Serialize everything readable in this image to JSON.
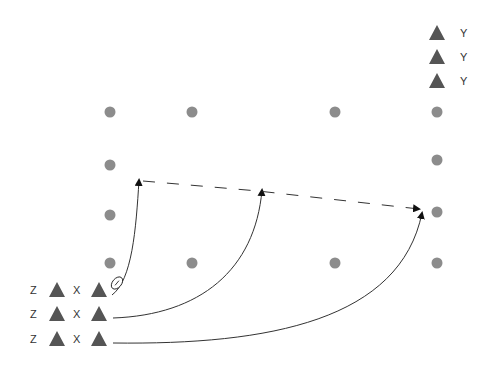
{
  "diagram": {
    "type": "play-diagram",
    "colors": {
      "dot": "#8c8c8c",
      "triangle": "#555555",
      "line": "#333333",
      "label": "#333333"
    },
    "dots": [
      {
        "x": 110,
        "y": 112
      },
      {
        "x": 192,
        "y": 112
      },
      {
        "x": 335,
        "y": 112
      },
      {
        "x": 437,
        "y": 112
      },
      {
        "x": 110,
        "y": 165
      },
      {
        "x": 437,
        "y": 160
      },
      {
        "x": 110,
        "y": 215
      },
      {
        "x": 437,
        "y": 212
      },
      {
        "x": 110,
        "y": 263
      },
      {
        "x": 192,
        "y": 263
      },
      {
        "x": 335,
        "y": 263
      },
      {
        "x": 437,
        "y": 263
      }
    ],
    "y_group": [
      {
        "label": "Y",
        "tx": 437,
        "ty": 33
      },
      {
        "label": "Y",
        "tx": 437,
        "ty": 57
      },
      {
        "label": "Y",
        "tx": 437,
        "ty": 81
      }
    ],
    "z_group": [
      {
        "label": "Z",
        "tx": 57,
        "ty": 290
      },
      {
        "label": "Z",
        "tx": 57,
        "ty": 314
      },
      {
        "label": "Z",
        "tx": 57,
        "ty": 339
      }
    ],
    "x_group": [
      {
        "label": "X",
        "tx": 99,
        "ty": 290
      },
      {
        "label": "X",
        "tx": 99,
        "ty": 314
      },
      {
        "label": "X",
        "tx": 99,
        "ty": 339
      }
    ],
    "ball_icon": "football-icon",
    "routes": [
      {
        "name": "route-1",
        "d": "M112 295 C 132 280, 136 230, 139 180"
      },
      {
        "name": "route-2",
        "d": "M113 318 C 200 315, 255 270, 262 190"
      },
      {
        "name": "route-3",
        "d": "M113 343 C 270 345, 400 320, 422 213"
      }
    ],
    "pass_line": {
      "d": "M143 181 L 258 191 L 419 209"
    }
  }
}
